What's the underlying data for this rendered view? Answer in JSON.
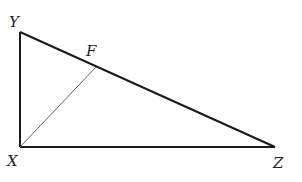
{
  "figure": {
    "type": "right triangle with segment",
    "vertices": {
      "Y": {
        "label": "Y",
        "x": 20,
        "y": 32
      },
      "X": {
        "label": "X",
        "x": 20,
        "y": 147
      },
      "Z": {
        "label": "Z",
        "x": 275,
        "y": 147
      }
    },
    "points": {
      "F": {
        "label": "F",
        "x": 96,
        "y": 67,
        "on_segment": "YZ"
      }
    },
    "segments": [
      {
        "name": "XY",
        "from": "X",
        "to": "Y",
        "weight": "thick"
      },
      {
        "name": "XZ",
        "from": "X",
        "to": "Z",
        "weight": "thick"
      },
      {
        "name": "YZ",
        "from": "Y",
        "to": "Z",
        "weight": "thick"
      },
      {
        "name": "XF",
        "from": "X",
        "to": "F",
        "weight": "thin"
      }
    ],
    "labels": {
      "Y": "Y",
      "F": "F",
      "X": "X",
      "Z": "Z"
    },
    "colors": {
      "stroke": "#1a1a1a",
      "thin_stroke": "#555555",
      "background": "#ffffff"
    }
  }
}
